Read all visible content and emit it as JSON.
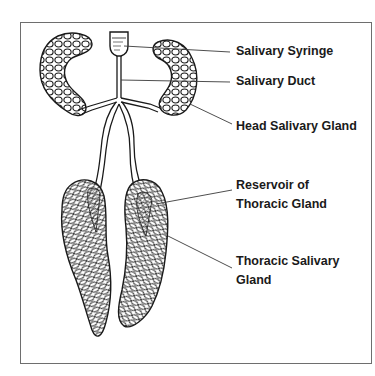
{
  "figure": {
    "clipped_header_text": "",
    "labels": {
      "salivary_syringe": "Salivary Syringe",
      "salivary_duct": "Salivary Duct",
      "head_salivary_gland": "Head Salivary Gland",
      "reservoir_line1": "Reservoir of",
      "reservoir_line2": "Thoracic Gland",
      "thoracic_line1": "Thoracic Salivary",
      "thoracic_line2": "Gland"
    },
    "colors": {
      "ink": "#1a1a1a",
      "frame": "#6e6e6e",
      "background": "#ffffff"
    }
  }
}
